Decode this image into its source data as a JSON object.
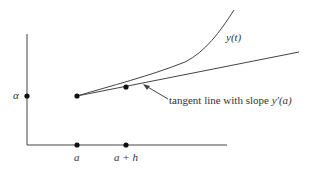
{
  "diagram": {
    "labels": {
      "alpha": "α",
      "a": "a",
      "a_plus_h": "a + h",
      "curve": "y(t)",
      "tangent_prefix": "tangent line with slope ",
      "tangent_slope": "y′(a)"
    },
    "colors": {
      "stroke": "#444444",
      "text": "#333333",
      "background": "#ffffff"
    }
  }
}
